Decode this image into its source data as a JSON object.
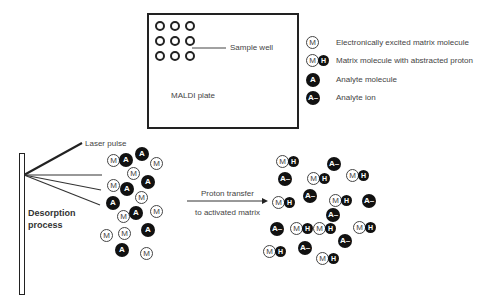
{
  "plate": {
    "label": "MALDI plate",
    "well_callout": "Sample well",
    "wells": [
      [
        0,
        0
      ],
      [
        1,
        0
      ],
      [
        2,
        0
      ],
      [
        0,
        1
      ],
      [
        1,
        1
      ],
      [
        2,
        1
      ],
      [
        0,
        2
      ],
      [
        1,
        2
      ],
      [
        2,
        2
      ]
    ]
  },
  "legend": {
    "items": [
      {
        "symbol": "M",
        "type": "matrix",
        "label": "Electronically excited matrix molecule"
      },
      {
        "symbol": "MH",
        "type": "matrix-proton",
        "label": "Matrix molecule with abstracted proton"
      },
      {
        "symbol": "A",
        "type": "analyte",
        "label": "Analyte molecule"
      },
      {
        "symbol": "A–",
        "type": "analyte-ion",
        "label": "Analyte ion"
      }
    ]
  },
  "symbols": {
    "M": "M",
    "H": "H",
    "A": "A",
    "A_ion": "A–"
  },
  "labels": {
    "laser_pulse": "Laser pulse",
    "desorption_line1": "Desorption",
    "desorption_line2": "process",
    "proton_transfer_line1": "Proton transfer",
    "proton_transfer_line2": "to activated matrix"
  },
  "left_cluster": [
    {
      "t": "M",
      "x": 113,
      "y": 160
    },
    {
      "t": "A",
      "x": 126,
      "y": 160
    },
    {
      "t": "A",
      "x": 142,
      "y": 154
    },
    {
      "t": "M",
      "x": 156,
      "y": 163
    },
    {
      "t": "M",
      "x": 133,
      "y": 173
    },
    {
      "t": "A",
      "x": 148,
      "y": 182
    },
    {
      "t": "M",
      "x": 113,
      "y": 185
    },
    {
      "t": "A",
      "x": 127,
      "y": 189
    },
    {
      "t": "M",
      "x": 141,
      "y": 197
    },
    {
      "t": "A",
      "x": 113,
      "y": 203
    },
    {
      "t": "M",
      "x": 123,
      "y": 216
    },
    {
      "t": "A",
      "x": 136,
      "y": 213
    },
    {
      "t": "M",
      "x": 156,
      "y": 211
    },
    {
      "t": "M",
      "x": 106,
      "y": 235
    },
    {
      "t": "M",
      "x": 124,
      "y": 233
    },
    {
      "t": "A",
      "x": 148,
      "y": 230
    },
    {
      "t": "A",
      "x": 122,
      "y": 250
    },
    {
      "t": "M",
      "x": 146,
      "y": 253
    }
  ],
  "right_cluster": [
    {
      "t": "MH",
      "x": 287,
      "y": 161
    },
    {
      "t": "A-",
      "x": 334,
      "y": 164
    },
    {
      "t": "A-",
      "x": 285,
      "y": 179
    },
    {
      "t": "MH",
      "x": 318,
      "y": 178
    },
    {
      "t": "MH",
      "x": 357,
      "y": 175
    },
    {
      "t": "MH",
      "x": 283,
      "y": 202
    },
    {
      "t": "A-",
      "x": 310,
      "y": 196
    },
    {
      "t": "MH",
      "x": 340,
      "y": 200
    },
    {
      "t": "A-",
      "x": 369,
      "y": 201
    },
    {
      "t": "A-",
      "x": 333,
      "y": 215
    },
    {
      "t": "A-",
      "x": 277,
      "y": 229
    },
    {
      "t": "MH",
      "x": 301,
      "y": 228
    },
    {
      "t": "MH",
      "x": 324,
      "y": 228
    },
    {
      "t": "MH",
      "x": 364,
      "y": 227
    },
    {
      "t": "A-",
      "x": 345,
      "y": 241
    },
    {
      "t": "MH",
      "x": 274,
      "y": 251
    },
    {
      "t": "A-",
      "x": 305,
      "y": 248
    },
    {
      "t": "MH",
      "x": 327,
      "y": 258
    }
  ]
}
